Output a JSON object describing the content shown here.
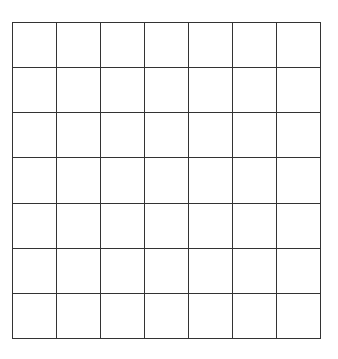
{
  "grid": {
    "rows": 7,
    "columns": 7,
    "line_color": "#333333",
    "background_color": "#ffffff",
    "cells": [
      [
        "",
        "",
        "",
        "",
        "",
        "",
        ""
      ],
      [
        "",
        "",
        "",
        "",
        "",
        "",
        ""
      ],
      [
        "",
        "",
        "",
        "",
        "",
        "",
        ""
      ],
      [
        "",
        "",
        "",
        "",
        "",
        "",
        ""
      ],
      [
        "",
        "",
        "",
        "",
        "",
        "",
        ""
      ],
      [
        "",
        "",
        "",
        "",
        "",
        "",
        ""
      ],
      [
        "",
        "",
        "",
        "",
        "",
        "",
        ""
      ]
    ]
  }
}
